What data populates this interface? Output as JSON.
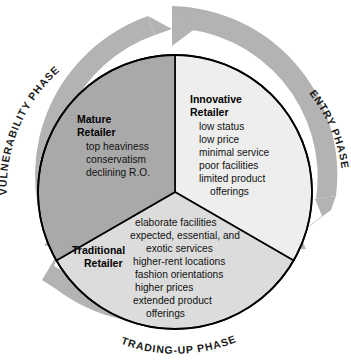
{
  "diagram": {
    "title": "Wheel of Retailing",
    "type": "cycle-diagram",
    "colors": {
      "ring": "#b3b3b3",
      "ring_shadow": "#9a9a9a",
      "mature_wedge": "#a9a9a9",
      "innovative_wedge": "#eeeeee",
      "traditional_wedge": "#dcdcdc",
      "outline": "#000000",
      "background": "#ffffff",
      "text": "#111111"
    },
    "phases": [
      {
        "id": "vulnerability",
        "label": "VULNERABILITY PHASE",
        "position": "left-arc"
      },
      {
        "id": "entry",
        "label": "ENTRY PHASE",
        "position": "right-arc"
      },
      {
        "id": "trading-up",
        "label": "TRADING-UP PHASE",
        "position": "bottom-arc"
      }
    ],
    "arrows": [
      {
        "id": "arrow-top",
        "direction": "clockwise",
        "position": "top"
      },
      {
        "id": "arrow-lower-right",
        "direction": "clockwise",
        "position": "lower-right"
      },
      {
        "id": "arrow-lower-left",
        "direction": "clockwise",
        "position": "lower-left"
      }
    ],
    "segments": [
      {
        "id": "innovative",
        "title_line1": "Innovative",
        "title_line2": "Retailer",
        "items": [
          "low status",
          "low price",
          "minimal service",
          "poor facilities",
          "limited product",
          "offerings"
        ]
      },
      {
        "id": "traditional",
        "title_line1": "Traditional",
        "title_line2": "Retailer",
        "items": [
          "elaborate facilities",
          "expected, essential, and",
          "exotic services",
          "higher-rent locations",
          "fashion orientations",
          "higher prices",
          "extended product",
          "offerings"
        ]
      },
      {
        "id": "mature",
        "title_line1": "Mature",
        "title_line2": "Retailer",
        "items": [
          "top heaviness",
          "conservatism",
          "declining R.O."
        ]
      }
    ]
  }
}
